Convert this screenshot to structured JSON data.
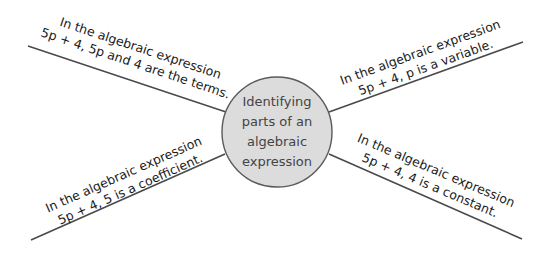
{
  "central_topic": {
    "lines": [
      "Identifying",
      "parts of an",
      "algebraic",
      "expression"
    ],
    "fill_color": "#dcdcdc",
    "border_color": "#5a5a5a"
  },
  "branches": [
    {
      "position": "top-left",
      "line1": "In the algebraic expression",
      "line2": "5p + 4, 5p and 4 are the terms."
    },
    {
      "position": "top-right",
      "line1": "In the algebraic expression",
      "line2": "5p + 4, p  is a variable."
    },
    {
      "position": "bottom-left",
      "line1": "In the algebraic expression",
      "line2": "5p + 4, 5 is a coefficient."
    },
    {
      "position": "bottom-right",
      "line1": "In the algebraic expression",
      "line2": "5p + 4, 4 is a constant."
    }
  ],
  "line_color": "#4a4a4a"
}
